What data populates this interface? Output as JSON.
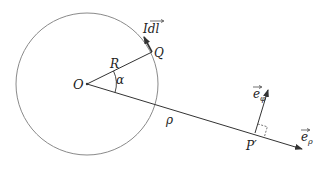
{
  "diagram": {
    "labels": {
      "origin": "O",
      "radius": "R",
      "point_q": "Q",
      "current_element": "Idl",
      "angle": "α",
      "distance": "ρ",
      "field_point": "P′",
      "e_phi": "e",
      "e_phi_sub": "φ",
      "e_rho": "e",
      "e_rho_sub": "ρ"
    },
    "colors": {
      "circle": "#8a8a8a",
      "lines": "#333333",
      "text": "#222222",
      "background": "#ffffff"
    }
  }
}
